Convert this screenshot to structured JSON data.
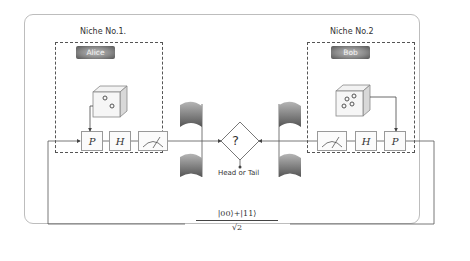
{
  "diagram": {
    "niche1": {
      "title": "Niche No.1.",
      "party": "Alice",
      "dice_pips": 2,
      "gates": [
        "P",
        "H"
      ],
      "meter": "measurement-meter"
    },
    "niche2": {
      "title": "Niche No.2",
      "party": "Bob",
      "dice_pips": 4,
      "gates": [
        "H",
        "P"
      ],
      "meter": "measurement-meter"
    },
    "decision": {
      "symbol": "?",
      "output_label": "Head or Tail"
    },
    "entangled_state": {
      "numerator": "|00⟩+|11⟩",
      "denominator": "√2"
    },
    "colors": {
      "line": "#555555",
      "box_border": "#999999",
      "outer_border": "#bdbdbd",
      "party_fill": "#8a8a8a"
    }
  }
}
